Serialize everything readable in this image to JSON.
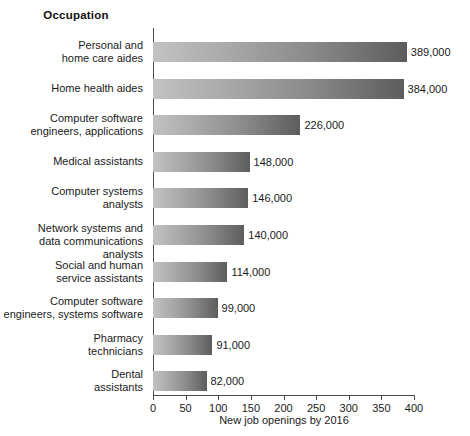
{
  "chart_data": {
    "type": "bar",
    "orientation": "horizontal",
    "title": "",
    "category_header": "Occupation",
    "xlabel": "New job openings by 2016",
    "ylabel": "",
    "xlim": [
      0,
      400
    ],
    "xticks": [
      0,
      50,
      100,
      150,
      200,
      250,
      300,
      350,
      400
    ],
    "xtick_labels": [
      "0",
      "50",
      "100",
      "150",
      "200",
      "250",
      "300",
      "350",
      "400"
    ],
    "units": "thousands",
    "grid": false,
    "legend": null,
    "categories": [
      "Personal and\nhome care aides",
      "Home health aides",
      "Computer software\nengineers, applications",
      "Medical assistants",
      "Computer systems\nanalysts",
      "Network systems and\ndata communications analysts",
      "Social and human\nservice assistants",
      "Computer software\nengineers, systems software",
      "Pharmacy\ntechnicians",
      "Dental\nassistants"
    ],
    "values": [
      389,
      384,
      226,
      148,
      146,
      140,
      114,
      99,
      91,
      82
    ],
    "data_labels": [
      "389,000",
      "384,000",
      "226,000",
      "148,000",
      "146,000",
      "140,000",
      "114,000",
      "99,000",
      "91,000",
      "82,000"
    ],
    "bars": [
      {
        "label_line1": "Personal and",
        "label_line2": "home care aides",
        "value": 389,
        "data_label": "389,000"
      },
      {
        "label_line1": "Home health aides",
        "label_line2": "",
        "value": 384,
        "data_label": "384,000"
      },
      {
        "label_line1": "Computer software",
        "label_line2": "engineers, applications",
        "value": 226,
        "data_label": "226,000"
      },
      {
        "label_line1": "Medical assistants",
        "label_line2": "",
        "value": 148,
        "data_label": "148,000"
      },
      {
        "label_line1": "Computer systems",
        "label_line2": "analysts",
        "value": 146,
        "data_label": "146,000"
      },
      {
        "label_line1": "Network systems and",
        "label_line2": "data communications analysts",
        "value": 140,
        "data_label": "140,000"
      },
      {
        "label_line1": "Social and human",
        "label_line2": "service assistants",
        "value": 114,
        "data_label": "114,000"
      },
      {
        "label_line1": "Computer software",
        "label_line2": "engineers, systems software",
        "value": 99,
        "data_label": "99,000"
      },
      {
        "label_line1": "Pharmacy",
        "label_line2": "technicians",
        "value": 91,
        "data_label": "91,000"
      },
      {
        "label_line1": "Dental",
        "label_line2": "assistants",
        "value": 82,
        "data_label": "82,000"
      }
    ],
    "colors": {
      "bar_gradient_start": "#c2c2c2",
      "bar_gradient_end": "#5d5d5d",
      "axis": "#4a4a4a",
      "text": "#1a1a1a",
      "background": "#ffffff"
    }
  }
}
